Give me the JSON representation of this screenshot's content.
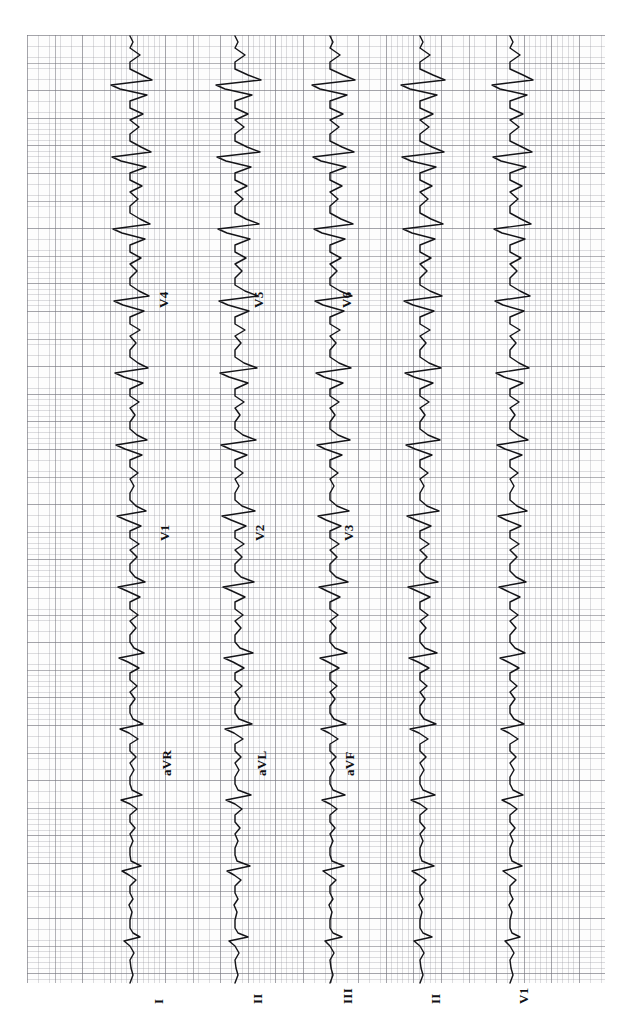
{
  "document": {
    "type": "12-lead electrocardiogram",
    "orientation": "rotated-90-clockwise",
    "paper": {
      "background_color": "#fdfdfd",
      "minor_grid_color": "#96969e",
      "major_grid_color": "#76767e",
      "trace_color": "#141418",
      "minor_box_px": 5.52,
      "major_box_px": 27.6
    }
  },
  "chart_data": {
    "type": "line",
    "xlabel": "",
    "ylabel": "",
    "grid": true,
    "legend_position": "inline-lead-labels",
    "paper_speed": "25 mm/s",
    "gain": "10 mm/mV",
    "columns": [
      {
        "index": 0,
        "baseline_px": 130,
        "leads": [
          "I",
          "aVR",
          "V1",
          "V4"
        ]
      },
      {
        "index": 1,
        "baseline_px": 235,
        "leads": [
          "II",
          "aVL",
          "V2",
          "V5"
        ]
      },
      {
        "index": 2,
        "baseline_px": 330,
        "leads": [
          "III",
          "aVF",
          "V3",
          "V6"
        ]
      },
      {
        "index": 3,
        "baseline_px": 420,
        "leads": [
          "II"
        ]
      },
      {
        "index": 4,
        "baseline_px": 510,
        "leads": [
          "V1"
        ]
      }
    ],
    "leads": [
      {
        "name": "I",
        "label": "I",
        "column": 0,
        "row": 3,
        "label_x": 167,
        "label_y": 988
      },
      {
        "name": "aVR",
        "label": "aVR",
        "column": 0,
        "row": 2,
        "label_x": 175,
        "label_y": 760
      },
      {
        "name": "V1",
        "label": "V1",
        "column": 0,
        "row": 1,
        "label_x": 173,
        "label_y": 525
      },
      {
        "name": "V4",
        "label": "V4",
        "column": 0,
        "row": 0,
        "label_x": 172,
        "label_y": 292
      },
      {
        "name": "II",
        "label": "II",
        "column": 1,
        "row": 3,
        "label_x": 266,
        "label_y": 988
      },
      {
        "name": "aVL",
        "label": "aVL",
        "column": 1,
        "row": 2,
        "label_x": 270,
        "label_y": 760
      },
      {
        "name": "V2",
        "label": "V2",
        "column": 1,
        "row": 1,
        "label_x": 268,
        "label_y": 525
      },
      {
        "name": "V5",
        "label": "V5",
        "column": 1,
        "row": 0,
        "label_x": 267,
        "label_y": 292
      },
      {
        "name": "III",
        "label": "III",
        "column": 2,
        "row": 3,
        "label_x": 356,
        "label_y": 988
      },
      {
        "name": "aVF",
        "label": "aVF",
        "column": 2,
        "row": 2,
        "label_x": 358,
        "label_y": 760
      },
      {
        "name": "V3",
        "label": "V3",
        "column": 2,
        "row": 1,
        "label_x": 357,
        "label_y": 525
      },
      {
        "name": "V6",
        "label": "V6",
        "column": 2,
        "row": 0,
        "label_x": 355,
        "label_y": 292
      },
      {
        "name": "II-rhythm",
        "label": "II",
        "column": 3,
        "row": 3,
        "label_x": 444,
        "label_y": 988
      },
      {
        "name": "V1-rhythm",
        "label": "V1",
        "column": 4,
        "row": 3,
        "label_x": 532,
        "label_y": 988
      }
    ]
  }
}
